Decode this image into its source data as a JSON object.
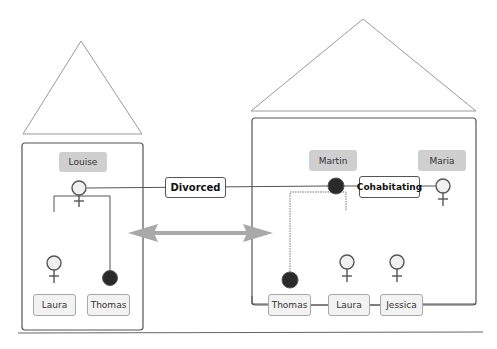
{
  "diagram": {
    "type": "family-households",
    "colors": {
      "line": "#555555",
      "roof": "#9a9a9a",
      "name_fill": "#cfcfcf",
      "male_fill": "#2a2a2a",
      "female_fill": "#f0f0f0",
      "arrow": "#a9a9a9"
    },
    "left_household": {
      "parent": {
        "name": "Louise",
        "gender": "female"
      },
      "children": [
        {
          "name": "Laura",
          "gender": "female"
        },
        {
          "name": "Thomas",
          "gender": "male"
        }
      ]
    },
    "right_household": {
      "parents": [
        {
          "name": "Martin",
          "gender": "male"
        },
        {
          "name": "Maria",
          "gender": "female"
        }
      ],
      "relationship": "Cohabitating",
      "children": [
        {
          "name": "Thomas",
          "gender": "male"
        },
        {
          "name": "Laura",
          "gender": "female"
        },
        {
          "name": "Jessica",
          "gender": "female"
        }
      ]
    },
    "between_households": {
      "relationship": "Divorced",
      "arrow": "bidirectional"
    }
  }
}
